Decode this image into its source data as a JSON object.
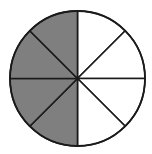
{
  "figure": {
    "type": "fraction-circle",
    "total_slices": 8,
    "shaded_slices": 4,
    "shaded_side": "left",
    "fraction_shaded": "4/8",
    "center": [
      77.5,
      78.5
    ],
    "radius": 67.5,
    "colors": {
      "shaded": "#7f7f7f",
      "unshaded": "#ffffff",
      "stroke": "#1a1a1a",
      "background": "#ffffff"
    }
  }
}
